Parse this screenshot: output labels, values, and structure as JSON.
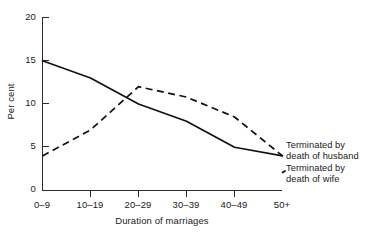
{
  "chart_data": {
    "type": "line",
    "title": "",
    "xlabel": "Duration of marriages",
    "ylabel": "Per cent",
    "categories": [
      "0–9",
      "10–19",
      "20–29",
      "30–39",
      "40–49",
      "50+"
    ],
    "ylim": [
      0,
      20
    ],
    "yticks": [
      0,
      5,
      10,
      15,
      20
    ],
    "grid": false,
    "legend_position": "right",
    "series": [
      {
        "name": "Terminated by death of husband",
        "style": "solid",
        "values": [
          15,
          13,
          10,
          8,
          5,
          4
        ]
      },
      {
        "name": "Terminated by death of wife",
        "style": "dashed",
        "values": [
          4,
          7,
          12,
          10.8,
          8.5,
          4
        ]
      }
    ]
  },
  "axes": {
    "y_title": "Per cent",
    "x_title": "Duration of marriages",
    "y_tick_labels": [
      "20",
      "15",
      "10",
      "5",
      "0"
    ],
    "x_tick_labels": [
      "0–9",
      "10–19",
      "20–29",
      "30–39",
      "40–49",
      "50+"
    ]
  },
  "legend": {
    "husband": {
      "line1": "Terminated by",
      "line2": "death of husband"
    },
    "wife": {
      "line1": "Terminated by",
      "line2": "death of wife"
    }
  },
  "colors": {
    "axis": "#2b2b2b",
    "series": "#111111",
    "background": "#ffffff"
  }
}
